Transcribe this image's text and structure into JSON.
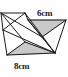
{
  "figure": {
    "kind": "geometry-diagram",
    "canvas": {
      "width": 68,
      "height": 77
    },
    "background_color": "#fefefe",
    "stroke_color": "#1c1c1c",
    "shade_color": "#c9c9c9",
    "shade_stroke_color": "#8a8a8a",
    "labels": {
      "top_right": "6cm",
      "bottom_left": "8cm"
    },
    "vertices": {
      "A_top_left": [
        1,
        13
      ],
      "B_apex_top": [
        25,
        13
      ],
      "C_top_right": [
        66,
        20
      ],
      "D_shade_top_left": [
        28,
        20
      ],
      "E_mid_left": [
        3,
        30
      ],
      "F_lower_left": [
        7,
        55
      ],
      "G_bottom_right": [
        55,
        53
      ],
      "H_inner": [
        25,
        42
      ],
      "I_apex_low": [
        42,
        37
      ]
    },
    "shaded_regions": [
      {
        "name": "upper-shaded-triangle",
        "points": "28,20 66,20 42,37"
      },
      {
        "name": "lower-shaded-triangle",
        "points": "7,55 55,53 25,42"
      }
    ],
    "line_segments": [
      {
        "name": "top-edge-left",
        "from": [
          1,
          13
        ],
        "to": [
          25,
          13
        ]
      },
      {
        "name": "top-edge-right",
        "from": [
          28,
          20
        ],
        "to": [
          66,
          20
        ]
      },
      {
        "name": "ridge-right",
        "from": [
          25,
          13
        ],
        "to": [
          28,
          20
        ]
      },
      {
        "name": "left-diagonal-a",
        "from": [
          1,
          13
        ],
        "to": [
          25,
          42
        ]
      },
      {
        "name": "left-diagonal-b",
        "from": [
          3,
          30
        ],
        "to": [
          25,
          13
        ]
      },
      {
        "name": "left-vertical",
        "from": [
          1,
          13
        ],
        "to": [
          3,
          30
        ]
      },
      {
        "name": "left-to-lower",
        "from": [
          3,
          30
        ],
        "to": [
          7,
          55
        ]
      },
      {
        "name": "base-edge",
        "from": [
          7,
          55
        ],
        "to": [
          55,
          53
        ]
      },
      {
        "name": "lower-apex-a",
        "from": [
          7,
          55
        ],
        "to": [
          25,
          42
        ]
      },
      {
        "name": "lower-apex-b",
        "from": [
          25,
          42
        ],
        "to": [
          55,
          53
        ]
      },
      {
        "name": "long-diagonal-1",
        "from": [
          3,
          30
        ],
        "to": [
          55,
          53
        ]
      },
      {
        "name": "long-diagonal-2",
        "from": [
          25,
          13
        ],
        "to": [
          55,
          53
        ]
      },
      {
        "name": "long-diagonal-3",
        "from": [
          1,
          13
        ],
        "to": [
          42,
          37
        ]
      },
      {
        "name": "right-fan-a",
        "from": [
          28,
          20
        ],
        "to": [
          42,
          37
        ]
      },
      {
        "name": "right-fan-b",
        "from": [
          66,
          20
        ],
        "to": [
          42,
          37
        ]
      },
      {
        "name": "right-fan-c",
        "from": [
          66,
          20
        ],
        "to": [
          55,
          53
        ]
      },
      {
        "name": "right-fan-d",
        "from": [
          42,
          37
        ],
        "to": [
          55,
          53
        ]
      },
      {
        "name": "cross-chord",
        "from": [
          28,
          20
        ],
        "to": [
          55,
          53
        ]
      }
    ]
  }
}
